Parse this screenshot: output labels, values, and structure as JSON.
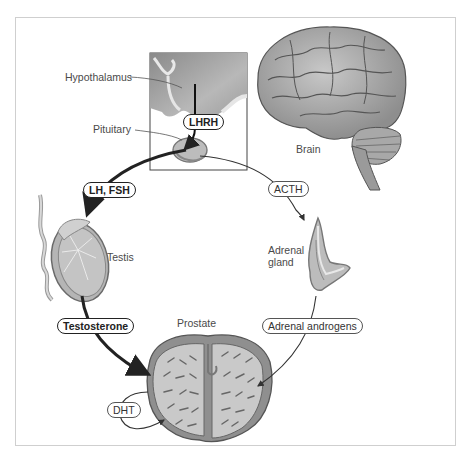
{
  "diagram": {
    "structures": {
      "hypothalamus": "Hypothalamus",
      "pituitary": "Pituitary",
      "brain": "Brain",
      "testis": "Testis",
      "adrenal_gland": "Adrenal\ngland",
      "adrenal_line1": "Adrenal",
      "adrenal_line2": "gland",
      "prostate": "Prostate"
    },
    "hormones": {
      "lhrh": "LHRH",
      "lh_fsh": "LH, FSH",
      "acth": "ACTH",
      "testosterone": "Testosterone",
      "adrenal_androgens": "Adrenal androgens",
      "dht": "DHT"
    },
    "pathways": [
      {
        "from": "Hypothalamus",
        "to": "Pituitary",
        "via": "LHRH",
        "weight": "bold"
      },
      {
        "from": "Pituitary",
        "to": "Testis",
        "via": "LH, FSH",
        "weight": "bold"
      },
      {
        "from": "Pituitary",
        "to": "Adrenal gland",
        "via": "ACTH",
        "weight": "thin"
      },
      {
        "from": "Testis",
        "to": "Prostate",
        "via": "Testosterone",
        "weight": "bold"
      },
      {
        "from": "Adrenal gland",
        "to": "Prostate",
        "via": "Adrenal androgens",
        "weight": "thin"
      },
      {
        "from": "Prostate",
        "to": "Prostate",
        "via": "DHT",
        "weight": "thin"
      }
    ],
    "colors": {
      "tissue_fill": "#bdbdbd",
      "tissue_dark": "#7a7a7a",
      "line": "#222222",
      "frame": "#cfcfcf"
    }
  }
}
